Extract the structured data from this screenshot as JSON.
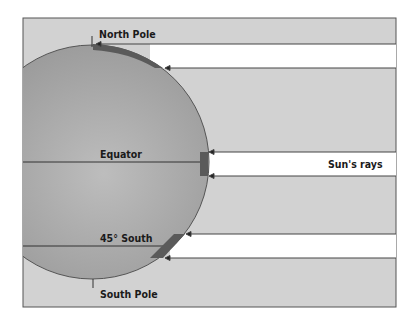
{
  "labels": {
    "north_pole": "North Pole",
    "equator": "Equator",
    "south_45": "45° South",
    "south_pole": "South Pole",
    "sun_rays": "Sun's rays"
  },
  "colors": {
    "background_panel": "#d2d2d2",
    "ray_band": "#ffffff",
    "earth": "#a9a9a9",
    "patch": "#5a5a5a",
    "line": "#3a3a3a"
  }
}
